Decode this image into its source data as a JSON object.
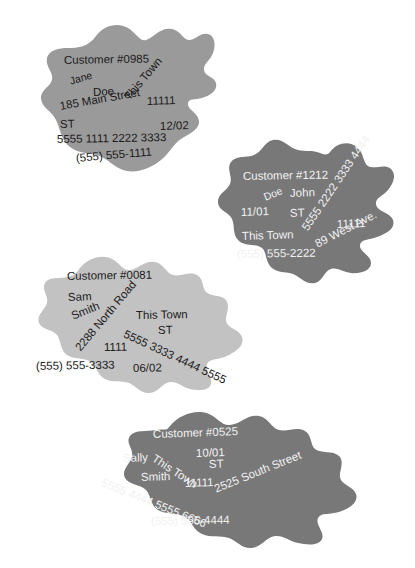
{
  "page": {
    "background_color": "#ffffff",
    "width": 415,
    "height": 568
  },
  "palette": {
    "blob_medium_gray": "#9a9a9a",
    "blob_dark_gray": "#787878",
    "blob_light_gray": "#c2c2c2",
    "text_dark": "#1b1b1b",
    "text_light": "#f2f2f2"
  },
  "records": [
    {
      "id": "record-0985",
      "customer_label": "Customer #0985",
      "first_name": "Jane",
      "last_name": "Doe",
      "street": "185 Main Street",
      "city": "This Town",
      "state": "ST",
      "zip": "11111",
      "card_number": "5555 1111 2222 3333",
      "expiry": "12/02",
      "phone": "(555) 555-1111",
      "fill": "#9a9a9a",
      "text_color": "#1b1b1b"
    },
    {
      "id": "record-1212",
      "customer_label": "Customer #1212",
      "first_name": "John",
      "last_name": "Doe",
      "street": "89 West Ave.",
      "city": "This Town",
      "state": "ST",
      "zip": "11111",
      "card_number": "5555 2222 3333 4444",
      "expiry": "11/01",
      "phone": "(555) 555-2222",
      "fill": "#787878",
      "text_color": "#f2f2f2"
    },
    {
      "id": "record-0081",
      "customer_label": "Customer #0081",
      "first_name": "Sam",
      "last_name": "Smith",
      "street": "2288 North Road",
      "city": "This Town",
      "state": "ST",
      "zip": "1111",
      "card_number": "5555 3333 4444 5555",
      "expiry": "06/02",
      "phone": "(555) 555-3333",
      "fill": "#c2c2c2",
      "text_color": "#1b1b1b"
    },
    {
      "id": "record-0525",
      "customer_label": "Customer #0525",
      "first_name": "Sally",
      "last_name": "Smith",
      "street": "2525 South Street",
      "city": "This Town",
      "state": "ST",
      "zip": "11111",
      "card_number": "5555 4444 5555 6666",
      "expiry": "10/01",
      "phone": "(555) 555-4444",
      "fill": "#787878",
      "text_color": "#f2f2f2"
    }
  ]
}
